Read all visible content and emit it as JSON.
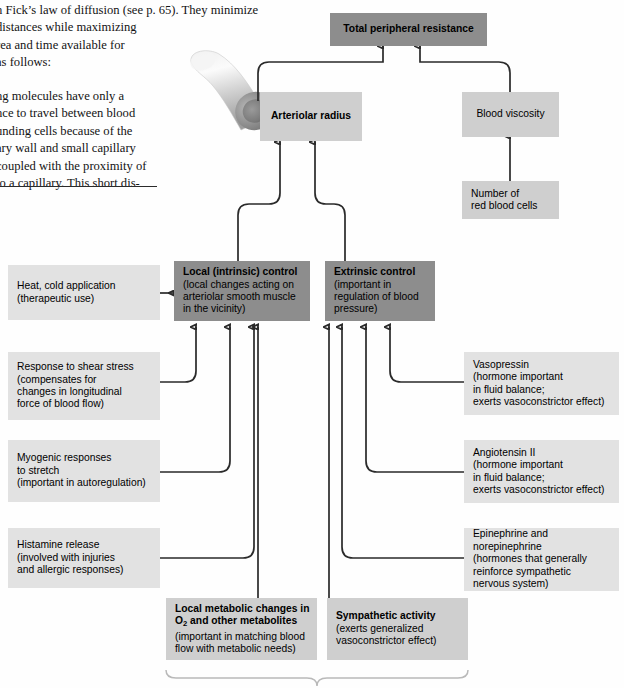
{
  "body_text": {
    "paragraph1_lines": [
      "n Fick’s law of diffusion (see p. 65). They minimize",
      "distances while maximizing",
      "rea and time available for",
      "as follows:"
    ],
    "paragraph2_lines": [
      "ng molecules have only a",
      "nce to travel between blood",
      "unding cells because of the",
      "ary wall and small capillary",
      "coupled with the proximity of",
      "to a capillary. This short dis-"
    ]
  },
  "diagram": {
    "total_peripheral_resistance": "Total peripheral resistance",
    "arteriolar_radius": "Arteriolar radius",
    "blood_viscosity": "Blood viscosity",
    "red_blood_cells": {
      "line1": "Number of",
      "line2": "red blood cells"
    },
    "local_control": {
      "title": "Local (intrinsic) control",
      "line1": "(local changes acting on",
      "line2": "arteriolar smooth muscle",
      "line3": "in the vicinity)"
    },
    "extrinsic_control": {
      "title": "Extrinsic control",
      "line1": "(important in",
      "line2": "regulation of blood",
      "line3": "pressure)"
    },
    "left_inputs": [
      {
        "name": "heat-cold-application",
        "line1": "Heat, cold application",
        "line2": "(therapeutic use)",
        "line3": "",
        "line4": ""
      },
      {
        "name": "shear-stress",
        "line1": "Response to shear stress",
        "line2": "(compensates for",
        "line3": "changes in longitudinal",
        "line4": "force of blood flow)"
      },
      {
        "name": "myogenic-responses",
        "line1": "Myogenic responses",
        "line2": "to stretch",
        "line3": "(important in autoregulation)",
        "line4": ""
      },
      {
        "name": "histamine-release",
        "line1": "Histamine release",
        "line2": "(involved with injuries",
        "line3": "and allergic responses)",
        "line4": ""
      }
    ],
    "right_inputs": [
      {
        "name": "vasopressin",
        "line1": "Vasopressin",
        "line2": "(hormone important",
        "line3": "in fluid balance;",
        "line4": "exerts vasoconstrictor effect)"
      },
      {
        "name": "angiotensin-ii",
        "line1": "Angiotensin II",
        "line2": "(hormone important",
        "line3": "in fluid balance;",
        "line4": "exerts vasoconstrictor effect)"
      },
      {
        "name": "epinephrine-norepinephrine",
        "line1": "Epinephrine and norepinephrine",
        "line2": "(hormones that generally",
        "line3": "reinforce sympathetic",
        "line4": "nervous system)"
      }
    ],
    "bottom_left": {
      "title_a": "Local metabolic changes in",
      "title_b": "O",
      "title_b_sub": "2",
      "title_b_rest": " and other metabolites",
      "line1": "(important in matching blood",
      "line2": "flow with metabolic needs)"
    },
    "bottom_right": {
      "title": "Sympathetic activity",
      "line1": "(exerts generalized",
      "line2": "vasoconstrictor effect)"
    }
  },
  "colors": {
    "dark_box": "#8d8d8d",
    "light_box": "#cfcfcf",
    "pale_box": "#e2e2e2",
    "connector": "#2a2a2a",
    "bracket": "#b9b9b9"
  }
}
